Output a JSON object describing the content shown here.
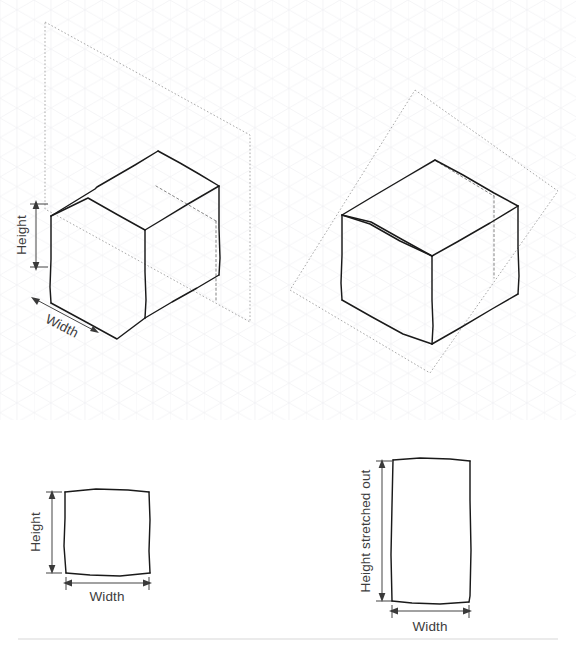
{
  "figure": {
    "background_color": "#ffffff",
    "ink_color": "#1a1a1a",
    "hidden_edge_color": "#6e6e6e",
    "plane_color": "#9a9a9a",
    "grid_color": "#f1f1f3",
    "label_color": "#3c3c3c",
    "divider_color": "#d8d8d8"
  },
  "panels": {
    "top_left": {
      "name": "upright-plane-box",
      "description": "Isometric rectangular box intersected by an upright dashed plane",
      "labels": {
        "height": "Height",
        "width": "Width"
      }
    },
    "top_right": {
      "name": "tilted-plane-box",
      "description": "Isometric rectangular box intersected by a tilted dashed plane",
      "labels": {}
    },
    "bottom_left": {
      "name": "square-face",
      "description": "Flat square face with height and width dimensions",
      "labels": {
        "height": "Height",
        "width": "Width"
      }
    },
    "bottom_right": {
      "name": "stretched-face",
      "description": "Flat stretched rectangle face with stretched height and width dimensions",
      "labels": {
        "height": "Height stretched out",
        "width": "Width"
      }
    }
  }
}
